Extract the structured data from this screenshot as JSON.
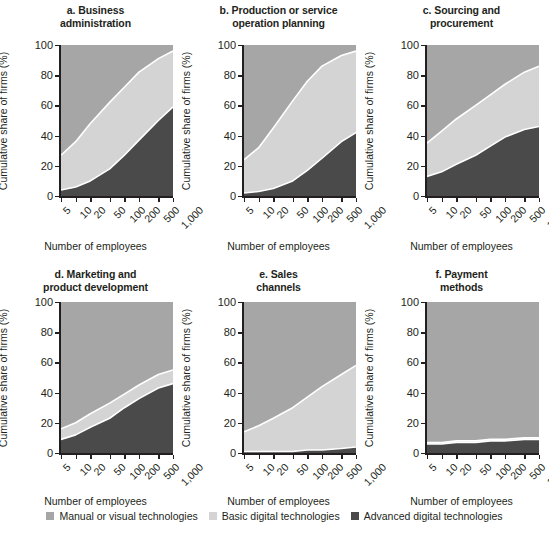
{
  "figure": {
    "xlabel": "Number of employees",
    "ylabel": "Cumulative share of firms (%)",
    "yticks": [
      "0",
      "20",
      "40",
      "60",
      "80",
      "100"
    ],
    "xticks": [
      "5",
      "10",
      "20",
      "50",
      "100",
      "200",
      "500",
      "1,000"
    ]
  },
  "legend": {
    "items": [
      {
        "label": "Manual or visual technologies",
        "color": "#a6a6a6",
        "name": "manual-or-visual"
      },
      {
        "label": "Basic digital technologies",
        "color": "#d4d4d4",
        "name": "basic-digital"
      },
      {
        "label": "Advanced digital technologies",
        "color": "#4a4a4a",
        "name": "advanced-digital"
      }
    ]
  },
  "chart_data": {
    "type": "area",
    "xlabel": "Number of employees",
    "ylabel": "Cumulative share of firms (%)",
    "ylim": [
      0,
      100
    ],
    "x": [
      5,
      10,
      20,
      50,
      100,
      200,
      500,
      1000
    ],
    "xtick_labels": [
      "5",
      "10",
      "20",
      "50",
      "100",
      "200",
      "500",
      "1,000"
    ],
    "xscale": "log",
    "grid": false,
    "legend_position": "bottom",
    "stack_order_bottom_to_top": [
      "Advanced digital technologies",
      "Basic digital technologies",
      "Manual or visual technologies"
    ],
    "note": "Values are cumulative shares (%). 'advanced_cum' is the lower band; 'basic_cum' is the cumulative top of the Basic band; Manual fills the remainder up to 100.",
    "panels": [
      {
        "id": "a",
        "title": "a. Business administration",
        "title_lines": [
          "a. Business",
          "administration"
        ],
        "series": [
          {
            "name": "Advanced digital technologies",
            "key": "advanced_cum",
            "values": [
              4,
              6,
              10,
              18,
              27,
              37,
              50,
              59
            ]
          },
          {
            "name": "Basic digital technologies",
            "key": "basic_cum",
            "values": [
              27,
              36,
              48,
              62,
              72,
              82,
              91,
              96
            ]
          },
          {
            "name": "Manual or visual technologies",
            "key": "manual_cum",
            "values": [
              100,
              100,
              100,
              100,
              100,
              100,
              100,
              100
            ]
          }
        ]
      },
      {
        "id": "b",
        "title": "b. Production or service operation planning",
        "title_lines": [
          "b. Production or service",
          "operation planning"
        ],
        "series": [
          {
            "name": "Advanced digital technologies",
            "key": "advanced_cum",
            "values": [
              2,
              3,
              5,
              10,
              17,
              25,
              36,
              42
            ]
          },
          {
            "name": "Basic digital technologies",
            "key": "basic_cum",
            "values": [
              24,
              32,
              45,
              63,
              76,
              86,
              93,
              96
            ]
          },
          {
            "name": "Manual or visual technologies",
            "key": "manual_cum",
            "values": [
              100,
              100,
              100,
              100,
              100,
              100,
              100,
              100
            ]
          }
        ]
      },
      {
        "id": "c",
        "title": "c. Sourcing and procurement",
        "title_lines": [
          "c. Sourcing and",
          "procurement"
        ],
        "series": [
          {
            "name": "Advanced digital technologies",
            "key": "advanced_cum",
            "values": [
              13,
              16,
              21,
              27,
              33,
              39,
              44,
              46
            ]
          },
          {
            "name": "Basic digital technologies",
            "key": "basic_cum",
            "values": [
              35,
              43,
              51,
              60,
              67,
              74,
              82,
              86
            ]
          },
          {
            "name": "Manual or visual technologies",
            "key": "manual_cum",
            "values": [
              100,
              100,
              100,
              100,
              100,
              100,
              100,
              100
            ]
          }
        ]
      },
      {
        "id": "d",
        "title": "d. Marketing and product development",
        "title_lines": [
          "d. Marketing and",
          "product development"
        ],
        "series": [
          {
            "name": "Advanced digital technologies",
            "key": "advanced_cum",
            "values": [
              9,
              12,
              17,
              23,
              30,
              36,
              43,
              46
            ]
          },
          {
            "name": "Basic digital technologies",
            "key": "basic_cum",
            "values": [
              16,
              20,
              26,
              33,
              39,
              45,
              52,
              55
            ]
          },
          {
            "name": "Manual or visual technologies",
            "key": "manual_cum",
            "values": [
              100,
              100,
              100,
              100,
              100,
              100,
              100,
              100
            ]
          }
        ]
      },
      {
        "id": "e",
        "title": "e. Sales channels",
        "title_lines": [
          "e. Sales",
          "channels"
        ],
        "series": [
          {
            "name": "Advanced digital technologies",
            "key": "advanced_cum",
            "values": [
              1,
              1,
              1,
              1,
              2,
              2,
              3,
              4
            ]
          },
          {
            "name": "Basic digital technologies",
            "key": "basic_cum",
            "values": [
              14,
              18,
              23,
              30,
              37,
              44,
              52,
              58
            ]
          },
          {
            "name": "Manual or visual technologies",
            "key": "manual_cum",
            "values": [
              100,
              100,
              100,
              100,
              100,
              100,
              100,
              100
            ]
          }
        ]
      },
      {
        "id": "f",
        "title": "f. Payment methods",
        "title_lines": [
          "f. Payment",
          "methods"
        ],
        "series": [
          {
            "name": "Advanced digital technologies",
            "key": "advanced_cum",
            "values": [
              6,
              6,
              7,
              7,
              8,
              8,
              9,
              9
            ]
          },
          {
            "name": "Basic digital technologies",
            "key": "basic_cum",
            "values": [
              7,
              7,
              8,
              8,
              9,
              9,
              10,
              10
            ]
          },
          {
            "name": "Manual or visual technologies",
            "key": "manual_cum",
            "values": [
              100,
              100,
              100,
              100,
              100,
              100,
              100,
              100
            ]
          }
        ]
      }
    ]
  }
}
